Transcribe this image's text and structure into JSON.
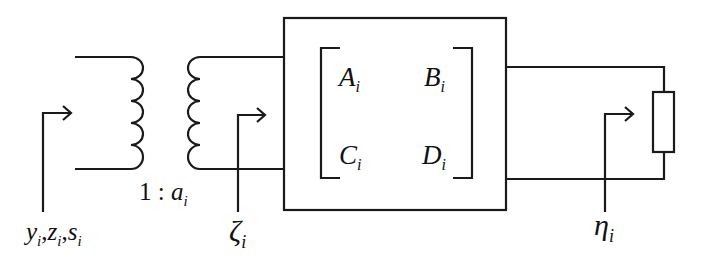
{
  "diagram": {
    "type": "two-port network with ideal transformer and load",
    "labels": {
      "input_quantities": {
        "text": "y",
        "sub": "i",
        "text2": "z",
        "sub2": "i",
        "text3": "s",
        "sub3": "i"
      },
      "turns_ratio": {
        "prefix": "1 : ",
        "text": "a",
        "sub": "i"
      },
      "transformer_output": {
        "text": "ζ",
        "sub": "i"
      },
      "load_quantity": {
        "text": "η",
        "sub": "i"
      }
    },
    "matrix": {
      "a": {
        "text": "A",
        "sub": "i"
      },
      "b": {
        "text": "B",
        "sub": "i"
      },
      "c": {
        "text": "C",
        "sub": "i"
      },
      "d": {
        "text": "D",
        "sub": "i"
      }
    },
    "components": [
      "primary-coil",
      "secondary-coil",
      "abcd-two-port-box",
      "load-resistor"
    ],
    "colors": {
      "line": "#1a1a1a",
      "background": "#ffffff"
    }
  }
}
